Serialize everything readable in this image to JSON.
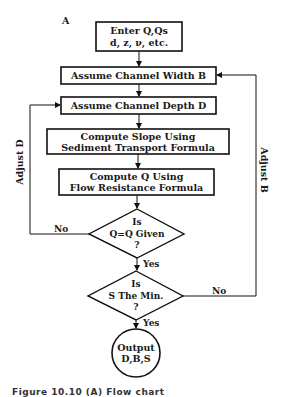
{
  "diagram": {
    "panel_label": "A",
    "nodes": {
      "enter": {
        "line1": "Enter Q,Qs",
        "line2": "d, z, ν, etc."
      },
      "width": {
        "label": "Assume Channel Width B"
      },
      "depth": {
        "label": "Assume Channel Depth D"
      },
      "slope": {
        "line1": "Compute Slope Using",
        "line2": "Sediment Transport Formula"
      },
      "computeq": {
        "line1": "Compute Q Using",
        "line2": "Flow Resistance Formula"
      },
      "decision1": {
        "line1": "Is",
        "line2": "Q=Q  Given",
        "line3": "?"
      },
      "decision2": {
        "line1": "Is",
        "line2": "S The Min.",
        "line3": "?"
      },
      "output": {
        "line1": "Output",
        "line2": "D,B,S"
      }
    },
    "edges": {
      "d1_no": "No",
      "d1_yes": "Yes",
      "d2_no": "No",
      "d2_yes": "Yes",
      "adjust_d": "Adjust D",
      "adjust_b": "Adjust B"
    }
  },
  "caption": "Figure 10.10 (A) Flow chart"
}
